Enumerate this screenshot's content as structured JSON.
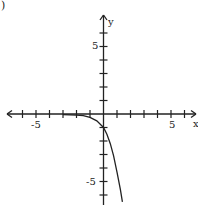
{
  "problem_marker": ")",
  "chart_data": {
    "type": "line",
    "title": "",
    "xlabel": "x",
    "ylabel": "y",
    "xlim": [
      -7,
      7
    ],
    "ylim": [
      -7,
      7
    ],
    "x_ticks": [
      -7,
      -6,
      -5,
      -4,
      -3,
      -2,
      -1,
      1,
      2,
      3,
      4,
      5,
      6
    ],
    "y_ticks": [
      -6,
      -5,
      -4,
      -3,
      -2,
      -1,
      1,
      2,
      3,
      4,
      5,
      6
    ],
    "x_tick_labels": {
      "-5": "-5",
      "5": "5"
    },
    "y_tick_labels": {
      "5": "5",
      "-5": "-5"
    },
    "grid": false,
    "series": [
      {
        "name": "curve",
        "description": "Decreasing exponential-type curve, asymptotic to y=0 on the left, passing through (0,-1) and falling steeply",
        "x": [
          -3.0,
          -2.0,
          -1.5,
          -1.0,
          -0.5,
          0.0,
          0.25,
          0.5,
          0.75,
          1.0,
          1.25,
          1.4
        ],
        "y": [
          -0.05,
          -0.08,
          -0.12,
          -0.25,
          -0.5,
          -1.0,
          -1.5,
          -2.2,
          -3.1,
          -4.3,
          -5.6,
          -6.5
        ]
      }
    ]
  },
  "labels": {
    "x_axis": "x",
    "y_axis": "y",
    "x_neg5": "-5",
    "x_pos5": "5",
    "y_pos5": "5",
    "y_neg5": "-5"
  }
}
